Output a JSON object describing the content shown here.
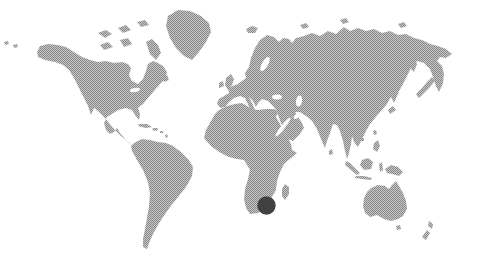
{
  "page": {
    "background": "#ffffff"
  },
  "map": {
    "type": "world-map",
    "style": "halftone-stipple-grayscale",
    "colors": {
      "background": "#ffffff",
      "land_dot_dark": "#878787",
      "land_dot_light": "#c8c8c8",
      "water": "#ffffff",
      "marker": "#414141"
    },
    "marker": {
      "name": "location-marker",
      "region_hint": "southern-africa",
      "cx": 266.5,
      "cy": 205.5,
      "r": 9.2,
      "color": "#414141"
    },
    "landmasses": [
      {
        "name": "north-america",
        "points": "37,52 40,46 48,44 58,45 66,47 74,52 82,57 90,60 98,62 106,61 114,63 122,62 128,64 131,68 129,75 132,81 138,84 143,79 146,71 148,64 153,61 158,63 163,66 167,72 165,79 160,84 154,91 148,98 143,104 138,108 140,114 139,120 135,115 132,110 126,108 118,110 112,114 107,117 104,123 106,130 110,134 114,132 117,128 120,133 124,138 129,143 134,147 139,151 133,146 127,141 121,136 115,130 109,123 104,117 99,112 94,108 91,115 88,106 84,98 79,88 74,78 69,70 63,65 55,62 45,60 38,57"
      },
      {
        "name": "greenland",
        "points": "168,16 178,10 190,11 201,16 209,23 211,32 206,42 199,52 192,60 184,56 176,48 170,38 166,26"
      },
      {
        "name": "south-america",
        "points": "134,143 142,139 150,140 158,142 166,143 173,146 181,152 188,159 193,167 192,176 186,187 178,197 170,207 163,217 158,225 153,234 149,243 147,249 143,247 143,239 145,229 147,218 149,206 150,194 148,182 143,170 137,160 132,151 131,146"
      },
      {
        "name": "africa",
        "points": "219,110 227,106 235,104 242,103 247,106 252,109 258,110 266,109 274,109 278,112 276,117 280,124 284,131 288,138 291,144 292,150 297,153 291,158 284,164 280,172 277,181 276,190 272,197 265,207 258,213 250,214 246,208 244,199 245,189 248,179 250,170 244,160 237,159 229,157 221,153 212,147 204,138 206,130 211,121 215,114"
      },
      {
        "name": "madagascar",
        "points": "285,184 289,187 289,194 285,200 282,196 282,189"
      },
      {
        "name": "eurasia",
        "points": "217,103 219,99 224,96 229,93 228,88 233,86 238,84 242,81 246,78 245,73 249,67 251,58 255,48 260,40 267,35 274,37 279,42 283,38 289,39 292,43 296,38 304,36 312,33 320,36 328,31 336,34 344,27 350,31 358,28 366,31 374,29 382,33 390,31 398,35 406,34 414,38 422,40 430,44 438,46 446,49 452,54 446,58 440,57 437,61 442,66 444,74 443,83 439,92 436,86 433,77 430,69 424,63 417,61 411,68 407,76 403,84 399,91 397,96 394,103 391,97 387,104 381,111 375,118 370,124 366,131 362,139 358,147 354,142 352,136 351,144 349,153 347,159 345,151 343,141 340,131 337,125 333,124 330,133 327,141 325,148 321,139 317,129 312,121 306,116 300,112 295,112 298,117 302,123 304,128 299,135 293,141 288,139 284,131 281,123 278,115 276,110 272,105 268,101 262,99 258,103 256,107 253,101 249,97 252,103 255,110 251,112 248,104 245,98 240,96 234,98 229,102 225,107 220,108"
      },
      {
        "name": "great-britain",
        "points": "226,78 231,74 234,79 232,85 228,90 225,85"
      },
      {
        "name": "ireland",
        "points": "219,83 223,81 224,86 219,88"
      },
      {
        "name": "iceland",
        "points": "246,29 252,26 258,28 255,33 248,33"
      },
      {
        "name": "japan-north",
        "points": "432,77 435,81 430,87 424,93 419,98 416,94 422,88 427,82"
      },
      {
        "name": "japan-south",
        "points": "388,110 393,106 396,110 390,114"
      },
      {
        "name": "sakhalin",
        "points": "412,62 415,58 417,64 414,72 411,69"
      },
      {
        "name": "taiwan",
        "points": "373,131 376,130 377,134 374,135"
      },
      {
        "name": "hainan",
        "points": "360,138 364,138 364,141 360,141"
      },
      {
        "name": "philippines",
        "points": "374,143 378,140 380,146 377,152 373,149"
      },
      {
        "name": "sri-lanka",
        "points": "329,151 332,149 333,154 329,155"
      },
      {
        "name": "sumatra",
        "points": "346,161 350,163 356,169 360,173 357,175 351,170 345,165"
      },
      {
        "name": "borneo",
        "points": "362,160 368,158 373,162 371,169 364,170 360,165"
      },
      {
        "name": "java",
        "points": "356,176 364,176 372,178 371,180 362,179 355,178"
      },
      {
        "name": "sulawesi",
        "points": "379,164 382,162 383,170 380,172"
      },
      {
        "name": "new-guinea",
        "points": "385,169 391,165 398,167 403,172 399,176 392,174 387,173"
      },
      {
        "name": "australia",
        "points": "371,188 378,185 385,186 389,189 392,185 396,181 399,186 403,193 406,201 407,209 403,216 398,219 391,221 384,219 377,215 370,217 365,213 363,206 364,198 367,192"
      },
      {
        "name": "tasmania",
        "points": "396,226 400,225 401,229 397,230"
      },
      {
        "name": "new-zealand-north",
        "points": "429,221 433,224 432,229 428,226"
      },
      {
        "name": "new-zealand-south",
        "points": "427,230 430,233 426,240 422,237"
      },
      {
        "name": "cuba",
        "points": "139,124 147,124 152,127 146,128 138,126"
      },
      {
        "name": "hispaniola",
        "points": "153,128 158,128 157,131 152,130"
      },
      {
        "name": "puerto-rico",
        "points": "160,131 163,131 163,133 160,133"
      },
      {
        "name": "lesser-antilles",
        "points": "165,135 167,134 168,137 166,138"
      },
      {
        "name": "newfoundland",
        "points": "162,77 167,75 169,80 164,82"
      },
      {
        "name": "baffin-island",
        "points": "146,42 152,39 158,45 161,53 156,60 150,54"
      },
      {
        "name": "arctic-island-1",
        "points": "98,33 106,30 112,34 105,38"
      },
      {
        "name": "arctic-island-2",
        "points": "118,28 126,25 131,30 123,33"
      },
      {
        "name": "arctic-island-3",
        "points": "137,22 145,20 149,25 141,27"
      },
      {
        "name": "arctic-island-4",
        "points": "100,45 108,42 113,47 104,50"
      },
      {
        "name": "arctic-island-5",
        "points": "120,40 128,38 132,44 124,47"
      },
      {
        "name": "russian-arctic-island-1",
        "points": "300,25 306,23 309,27 303,29"
      },
      {
        "name": "russian-arctic-island-2",
        "points": "340,20 346,18 349,22 343,24"
      },
      {
        "name": "russian-arctic-island-3",
        "points": "398,24 404,22 407,26 401,28"
      },
      {
        "name": "aleutian-island-1",
        "points": "4,42 8,41 9,44 5,45"
      },
      {
        "name": "aleutian-island-2",
        "points": "13,45 17,44 18,47 14,48"
      }
    ],
    "water_bodies": [
      {
        "name": "baltic-sea",
        "cx": 265,
        "cy": 64,
        "rx": 3,
        "ry": 8,
        "rot": 30
      },
      {
        "name": "black-sea",
        "cx": 277,
        "cy": 97,
        "rx": 5,
        "ry": 2.5,
        "rot": 0
      },
      {
        "name": "caspian-sea",
        "cx": 299,
        "cy": 101,
        "rx": 3,
        "ry": 5.5,
        "rot": 10
      },
      {
        "name": "red-sea",
        "cx": 283,
        "cy": 127,
        "rx": 2,
        "ry": 12,
        "rot": 38
      },
      {
        "name": "persian-gulf",
        "cx": 297,
        "cy": 116,
        "rx": 1.8,
        "ry": 4,
        "rot": 50
      },
      {
        "name": "great-lakes",
        "cx": 135,
        "cy": 90,
        "rx": 5,
        "ry": 2,
        "rot": -12
      }
    ]
  }
}
